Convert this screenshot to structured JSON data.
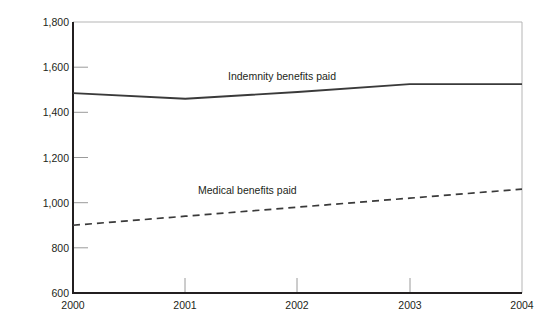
{
  "chart_data": {
    "type": "line",
    "title": "",
    "xlabel": "",
    "ylabel": "Millions of dollars",
    "x": [
      2000,
      2001,
      2002,
      2003,
      2004
    ],
    "categories": [
      "2000",
      "2001",
      "2002",
      "2003",
      "2004"
    ],
    "xlim": [
      2000,
      2004
    ],
    "ylim": [
      600,
      1800
    ],
    "ytick_values": [
      600,
      800,
      1000,
      1200,
      1400,
      1600,
      1800
    ],
    "ytick_labels": [
      "600",
      "800",
      "1,000",
      "1,200",
      "1,400",
      "1,600",
      "1,800"
    ],
    "xtick_labels": [
      "2000",
      "2001",
      "2002",
      "2003",
      "2004"
    ],
    "grid": false,
    "legend_position": "inline-annotation",
    "series": [
      {
        "name": "Indemnity benefits paid",
        "style": "solid",
        "color": "#3a3a3a",
        "values": [
          1485,
          1460,
          1490,
          1525,
          1525
        ],
        "label_text": "Indemnity benefits paid"
      },
      {
        "name": "Medical benefits paid",
        "style": "dashed",
        "color": "#3a3a3a",
        "values": [
          900,
          940,
          980,
          1020,
          1060
        ],
        "label_text": "Medical benefits paid"
      }
    ]
  },
  "colors": {
    "axis": "#231f20",
    "line": "#3a3a3a",
    "tick": "#8c8c8c",
    "background": "#ffffff"
  }
}
